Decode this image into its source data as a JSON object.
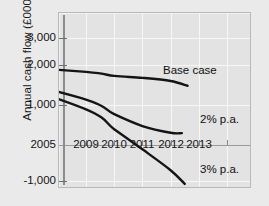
{
  "chart_data": {
    "type": "line",
    "title": "",
    "xlabel": "",
    "ylabel": "Annual cash flow (£000)",
    "ylim": [
      -1500,
      3400
    ],
    "xlim": [
      2005,
      2013.8
    ],
    "grid": true,
    "legend_position": "inline-annotation",
    "y_ticks": [
      "3,000",
      "2,000",
      "1,000",
      "-1,000"
    ],
    "y_tick_values": [
      3000,
      2000,
      1000,
      -1000
    ],
    "x_ticks": [
      "2005",
      "2009",
      "2010",
      "2011",
      "2012",
      "2013"
    ],
    "x_tick_values": [
      2005,
      2009,
      2010,
      2011,
      2012,
      2013
    ],
    "zero_axis_label": "2005",
    "series": [
      {
        "name": "Base case",
        "label": "Base case",
        "x": [
          2005.2,
          2009,
          2010,
          2011,
          2012,
          2012.6
        ],
        "values": [
          2050,
          1850,
          1750,
          1700,
          1620,
          1500
        ]
      },
      {
        "name": "2% p.a.",
        "label": "2% p.a.",
        "x": [
          2005.2,
          2009,
          2010,
          2011,
          2012,
          2012.4
        ],
        "values": [
          1860,
          1150,
          780,
          480,
          310,
          300
        ]
      },
      {
        "name": "3% p.a.",
        "label": "3% p.a.",
        "x": [
          2005.2,
          2009,
          2010,
          2011,
          2012,
          2012.5
        ],
        "values": [
          1850,
          900,
          400,
          -120,
          -700,
          -1080
        ]
      }
    ],
    "annotations": [
      {
        "text": "Base case",
        "x": 2011.3,
        "y": 1980
      },
      {
        "text": "2% p.a.",
        "x": 2012.5,
        "y": 620
      },
      {
        "text": "3% p.a.",
        "x": 2012.5,
        "y": -800
      }
    ],
    "colors": {
      "line": "#141414",
      "plot_background": "#e3e3e3",
      "page_background": "#eaeaea",
      "grid": "#f7f7f7",
      "axis": "#8c8c8c"
    }
  },
  "labels": {
    "y_axis_title": "Annual cash flow (£000)",
    "y_3000": "3,000",
    "y_2000": "2,000",
    "y_1000": "1,000",
    "y_zero_row": "2005",
    "y_neg1000": "-1,000",
    "x_2009": "2009",
    "x_2010": "2010",
    "x_2011": "2011",
    "x_2012": "2012",
    "x_2013": "2013",
    "series_base": "Base case",
    "series_2pct": "2% p.a.",
    "series_3pct": "3% p.a."
  }
}
